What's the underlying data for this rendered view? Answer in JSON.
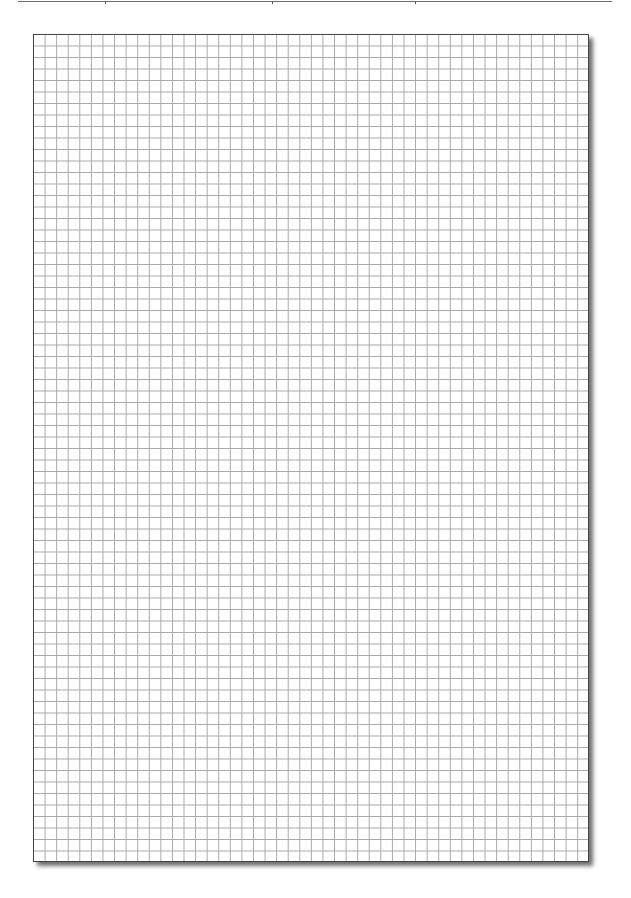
{
  "page": {
    "type": "graph-paper",
    "background_color": "#ffffff"
  },
  "header_rule": {
    "color": "#6e6e6e",
    "divider_positions_px": [
      105,
      272,
      415
    ]
  },
  "grid": {
    "columns": 48,
    "rows": 72,
    "line_color": "#a8a8a8",
    "border_color": "#444444",
    "shadow": "bottom-right drop shadow"
  }
}
